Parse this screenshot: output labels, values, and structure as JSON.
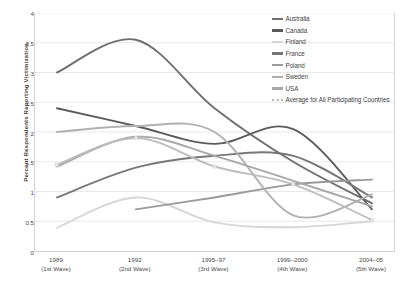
{
  "chart_data": {
    "type": "line",
    "title": "",
    "xlabel": "",
    "ylabel": "Percent Respondents Reporting Victimization.",
    "ylim": [
      0,
      4
    ],
    "ytick_labels": [
      "0",
      "0.5",
      "1",
      "1.5",
      "2",
      "2.5",
      "3",
      "3.5",
      "4"
    ],
    "ytick_values": [
      0,
      0.5,
      1,
      1.5,
      2,
      2.5,
      3,
      3.5,
      4
    ],
    "grid": "horizontal",
    "legend_position": "top-right",
    "categories": [
      "1989",
      "1992",
      "1995–97",
      "1999–2000",
      "2004–05"
    ],
    "category_sublabels": [
      "(1st Wave)",
      "(2nd Wave)",
      "(3rd Wave)",
      "(4th Wave)",
      "(5th Wave)"
    ],
    "series": [
      {
        "name": "Australia",
        "color": "#6e6e6e",
        "values": [
          3.0,
          3.55,
          2.4,
          1.5,
          0.8
        ]
      },
      {
        "name": "Canada",
        "color": "#5b5b5b",
        "values": [
          2.4,
          2.1,
          1.8,
          2.05,
          0.7
        ]
      },
      {
        "name": "Finland",
        "color": "#d6d6d6",
        "values": [
          0.39,
          0.9,
          0.48,
          0.4,
          0.5
        ]
      },
      {
        "name": "France",
        "color": "#777777",
        "values": [
          0.9,
          1.4,
          1.6,
          1.6,
          0.9
        ]
      },
      {
        "name": "Poland",
        "color": "#9a9a9a",
        "values": [
          null,
          0.7,
          0.9,
          1.12,
          1.2
        ]
      },
      {
        "name": "Sweden",
        "color": "#b0b0b0",
        "values": [
          2.0,
          2.1,
          2.0,
          0.6,
          0.95
        ]
      },
      {
        "name": "USA",
        "color": "#a8a8a8",
        "values": [
          1.42,
          1.92,
          1.6,
          1.18,
          0.75
        ]
      },
      {
        "name": "Average for All Participating Countries",
        "color": "#bcbcbc",
        "values": [
          1.45,
          1.9,
          1.42,
          1.12,
          0.52
        ],
        "style": "dotted-marker"
      }
    ]
  },
  "legend": {
    "items": [
      {
        "label": "Australia"
      },
      {
        "label": "Canada"
      },
      {
        "label": "Finland"
      },
      {
        "label": "France"
      },
      {
        "label": "Poland"
      },
      {
        "label": "Sweden"
      },
      {
        "label": "USA"
      },
      {
        "label": "Average for All Participating Countries"
      }
    ]
  }
}
